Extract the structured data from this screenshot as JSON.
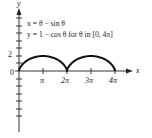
{
  "chart_data": {
    "type": "line",
    "title": "",
    "equations": {
      "line1": "x = θ − sin θ",
      "line2": "y = 1 − cos θ for θ in [0, 4π]"
    },
    "xlabel": "x",
    "ylabel": "y",
    "x_ticks": [
      "π",
      "2π",
      "3π",
      "4π"
    ],
    "x_tick_values": [
      3.1416,
      6.2832,
      9.4248,
      12.5664
    ],
    "y_tick_labels": [
      {
        "value": 2,
        "label": "2"
      }
    ],
    "origin_label": "0",
    "xlim": [
      0,
      13.2
    ],
    "ylim": [
      -7,
      7.5
    ],
    "grid": false,
    "series": [
      {
        "name": "cycloid",
        "parametric": true,
        "param": "θ",
        "param_range": [
          0,
          12.5664
        ],
        "x": [
          0,
          0.0783,
          0.5708,
          1.6,
          3.1416,
          4.6832,
          5.7124,
          6.2049,
          6.2832,
          6.3615,
          6.854,
          7.8832,
          9.4248,
          10.9664,
          11.9956,
          12.4881,
          12.5664
        ],
        "y": [
          0,
          0.2929,
          1,
          1.7071,
          2,
          1.7071,
          1,
          0.2929,
          0,
          0.2929,
          1,
          1.7071,
          2,
          1.7071,
          1,
          0.2929,
          0
        ]
      }
    ]
  },
  "labels": {
    "y_axis": "y",
    "x_axis": "x",
    "origin": "0",
    "y_two": "2",
    "pi": "π",
    "two_pi": "2π",
    "three_pi": "3π",
    "four_pi": "4π",
    "eq1": "x = θ − sin θ",
    "eq2": "y = 1 − cos θ for θ in [0, 4π]"
  }
}
